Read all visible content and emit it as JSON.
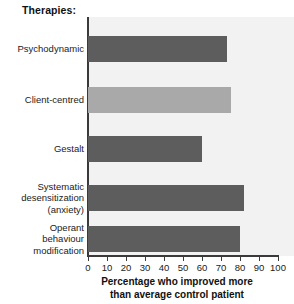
{
  "chart_data": {
    "type": "bar",
    "orientation": "horizontal",
    "title": "Therapies:",
    "xlabel_line1": "Percentage who improved more",
    "xlabel_line2": "than average control patient",
    "ylabel": "",
    "xlim": [
      0,
      100
    ],
    "grid": false,
    "legend": "none",
    "tick_labels": [
      "0",
      "10",
      "20",
      "30",
      "40",
      "50",
      "60",
      "70",
      "80",
      "90",
      "100"
    ],
    "tick_values": [
      0,
      10,
      20,
      30,
      40,
      50,
      60,
      70,
      80,
      90,
      100
    ],
    "categories": [
      "Psychodynamic",
      "Client-centred",
      "Gestalt",
      "Systematic desensitization (anxiety)",
      "Operant behaviour modification"
    ],
    "category_label_lines": [
      [
        "Psychodynamic"
      ],
      [
        "Client-centred"
      ],
      [
        "Gestalt"
      ],
      [
        "Systematic",
        "desensitization",
        "(anxiety)"
      ],
      [
        "Operant",
        "behaviour",
        "modification"
      ]
    ],
    "values": [
      73,
      75,
      60,
      82,
      80
    ],
    "bar_colors": [
      "#5d5d5d",
      "#a9a9a9",
      "#5d5d5d",
      "#5d5d5d",
      "#5d5d5d"
    ],
    "plot_background": "#f2f2f2",
    "axis_color": "#3a3a3a"
  }
}
